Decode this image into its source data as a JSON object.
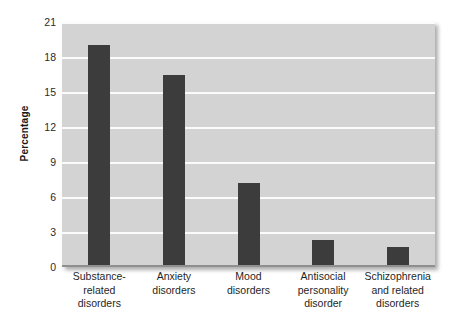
{
  "chart_data": {
    "type": "bar",
    "title": "",
    "xlabel": "",
    "ylabel": "Percentage",
    "ylim": [
      0,
      21
    ],
    "yticks": [
      0,
      3,
      6,
      9,
      12,
      15,
      18,
      21
    ],
    "ytick_labels": [
      "0",
      "3",
      "6",
      "9",
      "12",
      "15",
      "18",
      "21"
    ],
    "grid": true,
    "legend": "none",
    "categories": [
      "Substance-related disorders",
      "Anxiety disorders",
      "Mood disorders",
      "Antisocial personality disorder",
      "Schizophrenia and related disorders"
    ],
    "category_label_lines": [
      [
        "Substance-",
        "related",
        "disorders"
      ],
      [
        "Anxiety",
        "disorders"
      ],
      [
        "Mood",
        "disorders"
      ],
      [
        "Antisocial",
        "personality",
        "disorder"
      ],
      [
        "Schizophrenia",
        "and related",
        "disorders"
      ]
    ],
    "values": [
      19.0,
      16.5,
      7.2,
      2.3,
      1.7
    ],
    "colors": {
      "bar": "#3c3c3c",
      "plot_background": "#d3d3d3",
      "gridline": "#fbfbfb",
      "figure_background": "#ffffff",
      "text": "#1f1f1f"
    }
  }
}
